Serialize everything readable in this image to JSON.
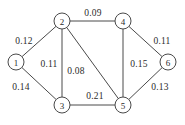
{
  "chart_data": {
    "type": "diagram",
    "diagram_kind": "weighted-undirected-graph",
    "title": "",
    "background_color": "#ffffff",
    "stroke_color": "#4a4a4a",
    "text_color": "#2b2b2b",
    "node_radius": 8,
    "nodes": [
      {
        "id": "1",
        "label": "1",
        "x": 16,
        "y": 62
      },
      {
        "id": "2",
        "label": "2",
        "x": 62,
        "y": 21
      },
      {
        "id": "3",
        "label": "3",
        "x": 62,
        "y": 105
      },
      {
        "id": "4",
        "label": "4",
        "x": 123,
        "y": 21
      },
      {
        "id": "5",
        "label": "5",
        "x": 123,
        "y": 105
      },
      {
        "id": "6",
        "label": "6",
        "x": 168,
        "y": 62
      }
    ],
    "edges": [
      {
        "source": "1",
        "target": "2",
        "weight": 0.12,
        "label": "0.12",
        "label_x": 24,
        "label_y": 41
      },
      {
        "source": "1",
        "target": "3",
        "weight": 0.14,
        "label": "0.14",
        "label_x": 21,
        "label_y": 87
      },
      {
        "source": "2",
        "target": "3",
        "weight": 0.11,
        "label": "0.11",
        "label_x": 49,
        "label_y": 64
      },
      {
        "source": "2",
        "target": "4",
        "weight": 0.09,
        "label": "0.09",
        "label_x": 93,
        "label_y": 13
      },
      {
        "source": "2",
        "target": "5",
        "weight": 0.08,
        "label": "0.08",
        "label_x": 76,
        "label_y": 71
      },
      {
        "source": "3",
        "target": "5",
        "weight": 0.21,
        "label": "0.21",
        "label_x": 95,
        "label_y": 96
      },
      {
        "source": "4",
        "target": "5",
        "weight": 0.15,
        "label": "0.15",
        "label_x": 139,
        "label_y": 64
      },
      {
        "source": "4",
        "target": "6",
        "weight": 0.11,
        "label": "0.11",
        "label_x": 162,
        "label_y": 41
      },
      {
        "source": "5",
        "target": "6",
        "weight": 0.13,
        "label": "0.13",
        "label_x": 160,
        "label_y": 87
      }
    ]
  }
}
